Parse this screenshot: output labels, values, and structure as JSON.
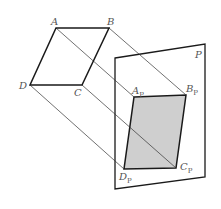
{
  "diagram": {
    "colors": {
      "stroke": "#1a1a1a",
      "projector": "#333333",
      "fill": "#cfcfcf",
      "label": "#555555"
    },
    "plane": {
      "label": "P",
      "corners": [
        [
          115,
          58
        ],
        [
          205,
          44
        ],
        [
          205,
          177
        ],
        [
          115,
          189
        ]
      ]
    },
    "original": {
      "points": {
        "A": [
          56,
          28
        ],
        "B": [
          109,
          28
        ],
        "C": [
          82,
          85
        ],
        "D": [
          30,
          85
        ]
      },
      "labels": {
        "A": "A",
        "B": "B",
        "C": "C",
        "D": "D"
      }
    },
    "projection": {
      "points": {
        "Ap": [
          134,
          97
        ],
        "Bp": [
          186,
          95
        ],
        "Cp": [
          176,
          168
        ],
        "Dp": [
          124,
          169
        ]
      },
      "labels": {
        "Ap": {
          "base": "A",
          "sub": "P"
        },
        "Bp": {
          "base": "B",
          "sub": "P"
        },
        "Cp": {
          "base": "C",
          "sub": "P"
        },
        "Dp": {
          "base": "D",
          "sub": "P"
        }
      }
    },
    "projectors": [
      {
        "from": "A",
        "to": "Ap"
      },
      {
        "from": "B",
        "to": "Bp"
      },
      {
        "from": "C",
        "to": "Cp"
      },
      {
        "from": "D",
        "to": "Dp"
      }
    ]
  }
}
